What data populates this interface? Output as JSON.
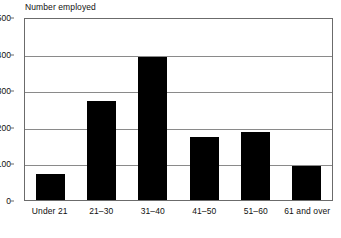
{
  "chart_data": {
    "type": "bar",
    "title": "Number employed",
    "xlabel": "",
    "ylabel": "Number employed",
    "categories": [
      "Under 21",
      "21–30",
      "31–40",
      "41–50",
      "51–60",
      "61 and over"
    ],
    "values": [
      70,
      270,
      390,
      172,
      185,
      92
    ],
    "ylim": [
      0,
      500
    ],
    "yticks": [
      0,
      100,
      200,
      300,
      400,
      500
    ],
    "ytick_labels": [
      "0",
      "100",
      "200",
      "300",
      "400",
      "500"
    ],
    "grid": true,
    "grid_axis": "y",
    "legend": null,
    "bar_color": "#000000",
    "axis_color": "#6b6b6b",
    "grid_color": "#8a8a8a",
    "background": "#ffffff"
  },
  "axis": {
    "y_title": "Number employed"
  }
}
